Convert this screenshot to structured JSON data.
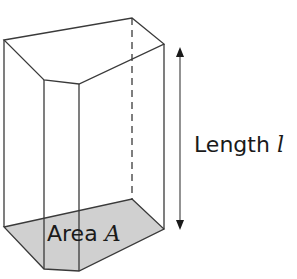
{
  "figure": {
    "type": "prism",
    "base_fill_color": "#d0d0d0",
    "edge_color": "#3a3a3a"
  },
  "labels": {
    "length_text": "Length",
    "length_symbol": "l",
    "area_text": "Area",
    "area_symbol": "A"
  }
}
